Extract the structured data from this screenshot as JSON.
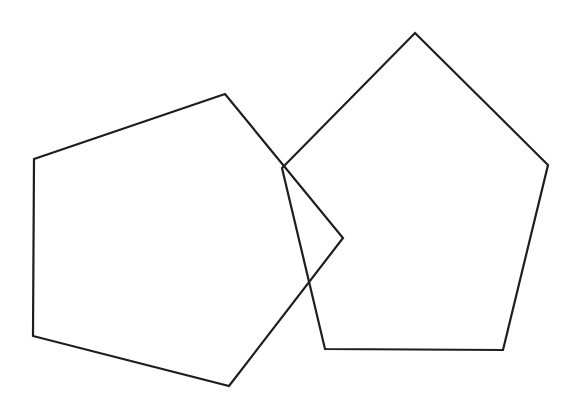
{
  "figure": {
    "width": 578,
    "height": 410,
    "background": "#ffffff",
    "stroke_color": "#1e1e1e",
    "stroke_width": 2.2,
    "shapes": [
      {
        "name": "left-pentagon",
        "type": "pentagon",
        "points": [
          [
            34,
            159
          ],
          [
            225,
            94
          ],
          [
            343,
            238
          ],
          [
            229,
            386
          ],
          [
            33,
            336
          ]
        ]
      },
      {
        "name": "right-pentagon",
        "type": "pentagon",
        "points": [
          [
            415,
            33
          ],
          [
            548,
            165
          ],
          [
            503,
            350
          ],
          [
            325,
            349
          ],
          [
            282,
            168
          ]
        ]
      }
    ]
  }
}
